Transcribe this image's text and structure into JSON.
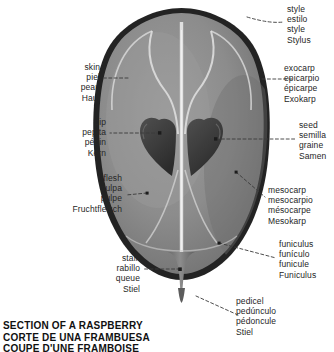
{
  "diagram": {
    "title_lines": {
      "en": "SECTION OF A RASPBERRY",
      "es": "CORTE DE UNA FRAMBUESA",
      "fr": "COUPE D'UNE FRAMBOISE"
    },
    "colors": {
      "background": "#ffffff",
      "skin_outer": "#1f1f1f",
      "exocarp_band": "#4a4a4a",
      "mesocarp": "#8e8e8e",
      "mesocarp_light": "#a5a5a5",
      "vascular_channel": "#e2e2e2",
      "seed": "#3d3d3d",
      "stalk": "#7c7c7c",
      "leader_line": "#3a3a3a",
      "text": "#262626"
    }
  },
  "labels": {
    "style": {
      "en": "style",
      "es": "estilo",
      "fr": "style",
      "de": "Stylus"
    },
    "exocarp": {
      "en": "exocarp",
      "es": "epicarpio",
      "fr": "épicarpe",
      "de": "Exokarp"
    },
    "seed": {
      "en": "seed",
      "es": "semilla",
      "fr": "graine",
      "de": "Samen"
    },
    "mesocarp": {
      "en": "mesocarp",
      "es": "mesocarpio",
      "fr": "mésocarpe",
      "de": "Mesokarp"
    },
    "funiculus": {
      "en": "funiculus",
      "es": "funículo",
      "fr": "funicule",
      "de": "Funiculus"
    },
    "pedicel": {
      "en": "pedicel",
      "es": "pedúnculo",
      "fr": "pédoncule",
      "de": "Stiel"
    },
    "skin": {
      "en": "skin",
      "es": "piel",
      "fr": "peau",
      "de": "Haut"
    },
    "pip": {
      "en": "pip",
      "es": "pepita",
      "fr": "pépin",
      "de": "Kern"
    },
    "flesh": {
      "en": "flesh",
      "es": "pulpa",
      "fr": "pulpe",
      "de": "Fruchtfleisch"
    },
    "stalk": {
      "en": "stalk",
      "es": "rabillo",
      "fr": "queue",
      "de": "Stiel"
    }
  }
}
